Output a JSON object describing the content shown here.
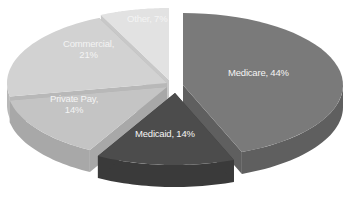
{
  "chart_data": {
    "type": "pie",
    "style": "3d-exploded",
    "title": "",
    "categories": [
      "Medicare",
      "Medicaid",
      "Private Pay",
      "Commercial",
      "Other"
    ],
    "values": [
      44,
      14,
      14,
      21,
      7
    ],
    "unit": "%",
    "colors": [
      "#7a7a7a",
      "#4c4c4c",
      "#c4c4c4",
      "#d2d2d2",
      "#e2e2e2"
    ],
    "side_colors": [
      "#5f5f5f",
      "#3a3a3a",
      "#a8a8a8",
      "#b8b8b8",
      "#c8c8c8"
    ],
    "legend": "none",
    "labels": [
      {
        "line1": "Medicare, 44%",
        "line2": ""
      },
      {
        "line1": "Medicaid, 14%",
        "line2": ""
      },
      {
        "line1": "Private Pay,",
        "line2": "14%"
      },
      {
        "line1": "Commercial,",
        "line2": "21%"
      },
      {
        "line1": "Other, 7%",
        "line2": ""
      }
    ]
  }
}
